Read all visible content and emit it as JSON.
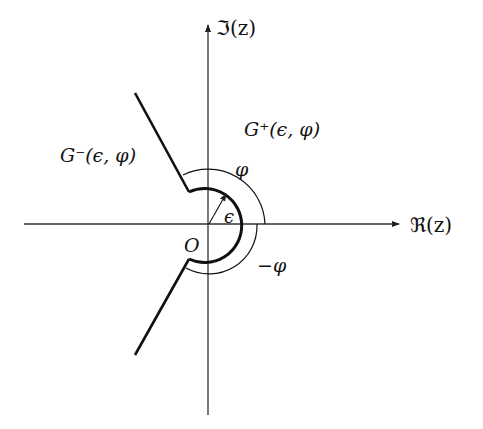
{
  "diagram": {
    "type": "complex-plane-region",
    "axes": {
      "imaginary_label": "ℑ(z)",
      "real_label": "ℜ(z)",
      "origin_label": "O"
    },
    "regions": {
      "upper_right": "G⁺(ϵ, φ)",
      "left": "G⁻(ϵ, φ)"
    },
    "angle_labels": {
      "positive": "φ",
      "negative": "−φ"
    },
    "radius_label": "ϵ",
    "colors": {
      "stroke": "#111111",
      "axis": "#333333",
      "background": "#ffffff"
    }
  }
}
